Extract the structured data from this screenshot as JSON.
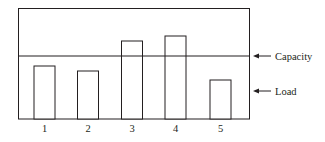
{
  "chart_data": {
    "type": "bar",
    "title": "",
    "xlabel": "",
    "ylabel": "",
    "categories": [
      "1",
      "2",
      "3",
      "4",
      "5"
    ],
    "series": [
      {
        "name": "Load",
        "values": [
          53,
          48,
          78,
          83,
          39
        ]
      }
    ],
    "reference_lines": [
      {
        "name": "Capacity",
        "value": 63,
        "orientation": "horizontal"
      }
    ],
    "annotations": [
      {
        "text": "Capacity",
        "points_to": "capacity-line",
        "arrow": "left"
      },
      {
        "text": "Load",
        "points_to": "bars",
        "arrow": "left"
      }
    ],
    "ylim": [
      0,
      111
    ],
    "grid": false,
    "bar_fill": "#ffffff",
    "line_color": "#231f20",
    "y_axis_ticks_shown": false
  },
  "labels": {
    "capacity": "Capacity",
    "load": "Load"
  }
}
